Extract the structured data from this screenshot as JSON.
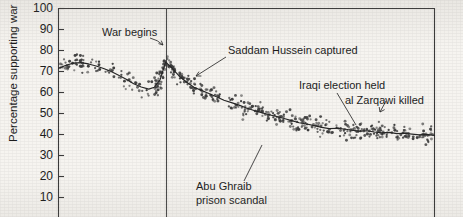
{
  "chart_data": {
    "type": "scatter",
    "title": "",
    "xlabel": "",
    "ylabel": "Percentage supporting war",
    "ylim": [
      10,
      100
    ],
    "ytick_labels": [
      "100",
      "90",
      "80",
      "70",
      "60",
      "50",
      "40",
      "30",
      "20",
      "10"
    ],
    "ytick_values": [
      100,
      90,
      80,
      70,
      60,
      50,
      40,
      30,
      20,
      10
    ],
    "grid": false,
    "legend": "none",
    "xlim_note": "x axis cropped out of image; time runs left (pre-war) to right (post-war)",
    "annotations": [
      {
        "id": "war-begins",
        "label": "War begins",
        "line1": "War begins",
        "line2": ""
      },
      {
        "id": "saddam-captured",
        "label": "Saddam Hussein captured",
        "line1": "Saddam Hussein captured",
        "line2": ""
      },
      {
        "id": "abu-ghraib",
        "label": "Abu Ghraib prison scandal",
        "line1": "Abu Ghraib",
        "line2": "prison scandal"
      },
      {
        "id": "iraqi-election",
        "label": "Iraqi election held",
        "line1": "Iraqi election held",
        "line2": ""
      },
      {
        "id": "zarqawi-killed",
        "label": "al Zarqawi killed",
        "line1": "al Zarqawi killed",
        "line2": ""
      }
    ],
    "vertical_rule": {
      "id": "war-begins-rule",
      "label": "War begins",
      "x_fraction": 0.285
    },
    "trend_series": {
      "name": "smoothed trend",
      "x": [
        0.0,
        0.02,
        0.04,
        0.06,
        0.08,
        0.1,
        0.12,
        0.14,
        0.16,
        0.18,
        0.2,
        0.22,
        0.24,
        0.255,
        0.27,
        0.285,
        0.3,
        0.32,
        0.34,
        0.36,
        0.38,
        0.4,
        0.42,
        0.44,
        0.46,
        0.48,
        0.5,
        0.52,
        0.54,
        0.56,
        0.58,
        0.6,
        0.62,
        0.64,
        0.66,
        0.68,
        0.7,
        0.72,
        0.74,
        0.76,
        0.78,
        0.8,
        0.82,
        0.84,
        0.86,
        0.88,
        0.9,
        0.92,
        0.94,
        0.96,
        0.98,
        1.0
      ],
      "y": [
        71.5,
        73.0,
        74.0,
        74.2,
        73.6,
        72.6,
        71.4,
        70.0,
        68.2,
        66.3,
        64.2,
        62.6,
        61.6,
        62.5,
        66.0,
        74.5,
        72.0,
        68.0,
        65.0,
        62.5,
        61.0,
        59.5,
        58.0,
        56.3,
        55.2,
        54.0,
        52.6,
        51.4,
        50.4,
        49.4,
        48.6,
        47.6,
        46.6,
        45.6,
        45.0,
        44.2,
        43.4,
        42.8,
        43.0,
        42.6,
        42.0,
        41.6,
        41.8,
        41.2,
        40.8,
        41.0,
        40.4,
        40.6,
        40.2,
        39.8,
        40.0,
        39.6
      ]
    },
    "scatter_summary": {
      "n_points": 520,
      "y_range_prewar": [
        58,
        81
      ],
      "y_range_peak": [
        62,
        82
      ],
      "y_range_end": [
        33,
        50
      ],
      "marker": "open/filled small circle",
      "marker_color": "#3d3d3d"
    }
  },
  "colors": {
    "background": "#f6f4f0",
    "ink": "#1d1d1d",
    "axis": "#3a3a3a",
    "marker": "#3d3d3d",
    "trend": "#262626"
  }
}
